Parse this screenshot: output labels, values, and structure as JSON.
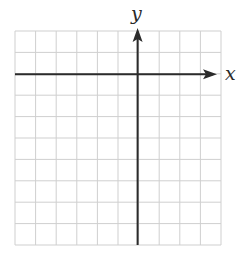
{
  "diagram": {
    "type": "coordinate-grid",
    "x_axis_label": "x",
    "y_axis_label": "y",
    "grid": {
      "columns": 10,
      "rows": 10,
      "left": 15,
      "top": 31,
      "right": 221,
      "bottom": 245,
      "line_color": "#cfcfcf"
    },
    "axes": {
      "origin_column": 6,
      "origin_row": 2,
      "color": "#2b2b2b",
      "x_arrow": "right",
      "y_arrow": "up"
    }
  }
}
